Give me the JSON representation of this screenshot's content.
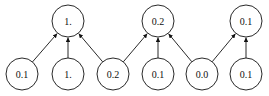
{
  "diagram": {
    "top_nodes": [
      {
        "id": "t0",
        "label": "1.",
        "x": 68,
        "y": 21
      },
      {
        "id": "t1",
        "label": "0.2",
        "x": 158,
        "y": 21
      },
      {
        "id": "t2",
        "label": "0.1",
        "x": 246,
        "y": 21
      }
    ],
    "bottom_nodes": [
      {
        "id": "b0",
        "label": "0.1",
        "x": 22,
        "y": 74
      },
      {
        "id": "b1",
        "label": "1.",
        "x": 68,
        "y": 74
      },
      {
        "id": "b2",
        "label": "0.2",
        "x": 113,
        "y": 74
      },
      {
        "id": "b3",
        "label": "0.1",
        "x": 158,
        "y": 74
      },
      {
        "id": "b4",
        "label": "0.0",
        "x": 202,
        "y": 74
      },
      {
        "id": "b5",
        "label": "0.1",
        "x": 246,
        "y": 74
      }
    ],
    "edges": [
      [
        "b0",
        "t0"
      ],
      [
        "b1",
        "t0"
      ],
      [
        "b2",
        "t0"
      ],
      [
        "b2",
        "t1"
      ],
      [
        "b3",
        "t1"
      ],
      [
        "b4",
        "t1"
      ],
      [
        "b4",
        "t2"
      ],
      [
        "b5",
        "t2"
      ]
    ],
    "radius": 16
  }
}
